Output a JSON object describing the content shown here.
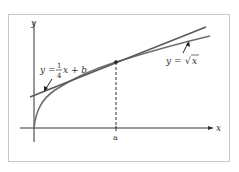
{
  "figure": {
    "frame_color": "#c8c8c8",
    "axis_color": "#333333",
    "curve_color": "#6e6e6e",
    "tangent_color": "#5a5a5a",
    "axes": {
      "x_label": "x",
      "y_label": "y"
    },
    "tangent_line": {
      "label_prefix": "y = ",
      "fraction_numerator": "1",
      "fraction_denominator": "4",
      "label_suffix": "x + b"
    },
    "curve": {
      "label_prefix": "y = ",
      "radical": "√",
      "radicand": "x"
    },
    "point": {
      "label": "a"
    }
  }
}
